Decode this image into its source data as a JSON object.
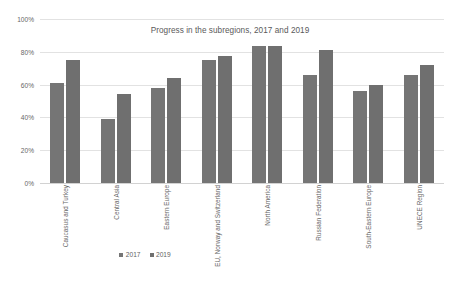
{
  "chart_data": {
    "type": "bar",
    "title": "Progress in the subregions, 2017 and 2019",
    "xlabel": "",
    "ylabel": "",
    "ylim": [
      0,
      100
    ],
    "ytick_labels": [
      "100%",
      "80%",
      "60%",
      "40%",
      "20%",
      "0%"
    ],
    "ytick_values": [
      100,
      80,
      60,
      40,
      20,
      0
    ],
    "grid": true,
    "legend_position": "bottom-left",
    "categories": [
      "Caucasus and Turkey",
      "Central Asia",
      "Eastern Europe",
      "EU, Norway and Switzerland",
      "North America",
      "Russian Federation",
      "South-Eastern Europe",
      "UNECE Region"
    ],
    "series": [
      {
        "name": "2017",
        "color": "#757575",
        "values": [
          61,
          39,
          58,
          75,
          83.5,
          66,
          56,
          66
        ]
      },
      {
        "name": "2019",
        "color": "#6f6f6f",
        "values": [
          75,
          54,
          64,
          77.5,
          83.5,
          81,
          60,
          72
        ]
      }
    ]
  },
  "legend": {
    "items": [
      {
        "label": "2017"
      },
      {
        "label": "2019"
      }
    ]
  }
}
